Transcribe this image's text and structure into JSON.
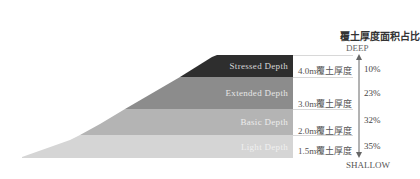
{
  "title": "覆土厚度面积占比",
  "axis": {
    "top_label": "DEEP",
    "bottom_label": "SHALLOW"
  },
  "layers": [
    {
      "name": "Stressed Depth",
      "thickness": "4.0m覆土厚度",
      "percent": "10%",
      "color": "#2e2e2e"
    },
    {
      "name": "Extended Depth",
      "thickness": "3.0m覆土厚度",
      "percent": "23%",
      "color": "#8c8c8c"
    },
    {
      "name": "Basic Depth",
      "thickness": "2.0m覆土厚度",
      "percent": "32%",
      "color": "#b4b4b4"
    },
    {
      "name": "Light Depth",
      "thickness": "1.5m覆土厚度",
      "percent": "35%",
      "color": "#d5d5d5"
    }
  ]
}
